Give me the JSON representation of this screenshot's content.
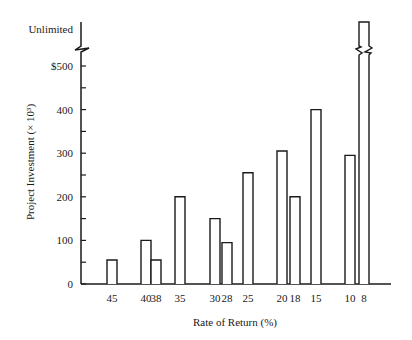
{
  "chart_data": {
    "type": "bar",
    "title": "",
    "xlabel": "Rate of Return (%)",
    "ylabel": "Project Investment (× 10³)",
    "ylim": [
      0,
      500
    ],
    "y_ticks": [
      {
        "value": 0,
        "label": "0"
      },
      {
        "value": 100,
        "label": "100"
      },
      {
        "value": 200,
        "label": "200"
      },
      {
        "value": 300,
        "label": "300"
      },
      {
        "value": 400,
        "label": "400"
      },
      {
        "value": 500,
        "label": "$500"
      }
    ],
    "y_break_label": "Unlimited",
    "grid": false,
    "categories": [
      "45",
      "40",
      "38",
      "35",
      "30",
      "28",
      "25",
      "20",
      "18",
      "15",
      "10",
      "8"
    ],
    "values": [
      55,
      100,
      55,
      200,
      150,
      95,
      255,
      305,
      200,
      400,
      295,
      "Unlimited"
    ],
    "bars": [
      {
        "label": "45",
        "value": 55
      },
      {
        "label": "40",
        "value": 100
      },
      {
        "label": "38",
        "value": 55
      },
      {
        "label": "35",
        "value": 200
      },
      {
        "label": "30",
        "value": 150
      },
      {
        "label": "28",
        "value": 95
      },
      {
        "label": "25",
        "value": 255
      },
      {
        "label": "20",
        "value": 305
      },
      {
        "label": "18",
        "value": 200
      },
      {
        "label": "15",
        "value": 400
      },
      {
        "label": "10",
        "value": 295
      },
      {
        "label": "8",
        "value": "Unlimited"
      }
    ]
  }
}
